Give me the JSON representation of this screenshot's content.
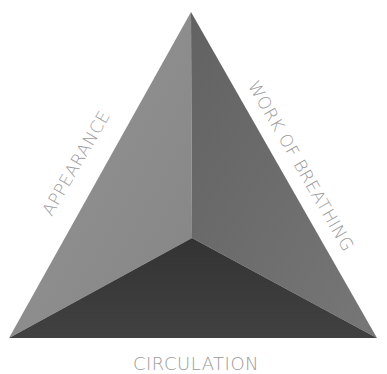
{
  "diagram": {
    "type": "assessment-triangle",
    "vertices": {
      "apex": [
        191,
        12
      ],
      "bottom_left": [
        9,
        338
      ],
      "bottom_right": [
        377,
        338
      ],
      "center": [
        192,
        238
      ]
    },
    "faces": {
      "left": {
        "side": "APPEARANCE",
        "color": "#8a8a8a"
      },
      "right": {
        "side": "WORK OF BREATHING",
        "color": "#6c6c6c"
      },
      "bottom": {
        "side": "CIRCULATION",
        "color": "#3a3a3a"
      }
    },
    "labels": {
      "left": "APPEARANCE",
      "right": "WORK OF BREATHING",
      "bottom": "CIRCULATION"
    },
    "label_color": "#9a9a9a"
  }
}
